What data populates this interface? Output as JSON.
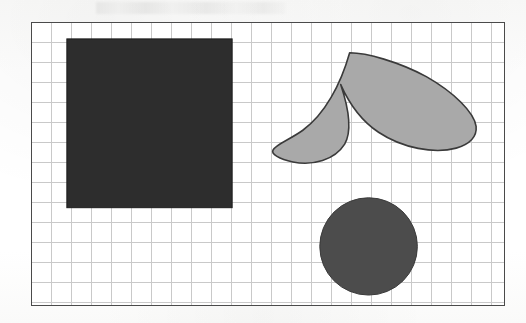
{
  "figure": {
    "canvas": {
      "width": 526,
      "height": 323,
      "background": "#fdfdfc"
    },
    "frame": {
      "name": "figure-frame",
      "x": 31,
      "y": 22,
      "width": 474,
      "height": 284,
      "border_color": "#4a4a4a",
      "border_width": 1.5,
      "fill": "#ffffff"
    },
    "grid": {
      "name": "grid",
      "cell_size": 20,
      "line_color": "#c9c9c9",
      "line_width": 0.8,
      "columns": 24,
      "rows": 14,
      "visible": true
    },
    "shapes": [
      {
        "id": "dark-square",
        "label": "Square",
        "type": "rect",
        "x": 35,
        "y": 16,
        "width": 166,
        "height": 170,
        "fill": "#2d2d2d",
        "stroke": "#1c1c1c",
        "stroke_width": 1
      },
      {
        "id": "gray-crescent",
        "label": "Crescent",
        "type": "path",
        "path": "M 319 30 C 322 58 330 84 350 104 C 372 126 404 136 424 130 C 440 126 446 116 444 104 C 440 82 418 62 392 50 C 364 37 336 30 319 30 Z",
        "path_render": "M 319 30 C 311 62 300 92 282 112 C 263 134 247 140 242 134 C 238 128 244 118 258 108 C 288 86 306 58 319 30 Z",
        "fill": "#a9a9a9",
        "stroke": "#3a3a3a",
        "stroke_width": 1.6,
        "tip_top": [
          319,
          30
        ],
        "tip_right": [
          446,
          88
        ],
        "tip_left": [
          242,
          130
        ]
      },
      {
        "id": "dark-circle",
        "label": "Circle",
        "type": "circle",
        "cx": 338,
        "cy": 225,
        "r": 49,
        "fill": "#4c4c4c",
        "stroke": "#3a3a3a",
        "stroke_width": 1
      }
    ],
    "colors": {
      "square_fill": "#2d2d2d",
      "crescent_fill": "#a9a9a9",
      "circle_fill": "#4c4c4c",
      "grid_line": "#c9c9c9",
      "frame_border": "#4a4a4a",
      "page_background": "#fdfdfc"
    }
  }
}
